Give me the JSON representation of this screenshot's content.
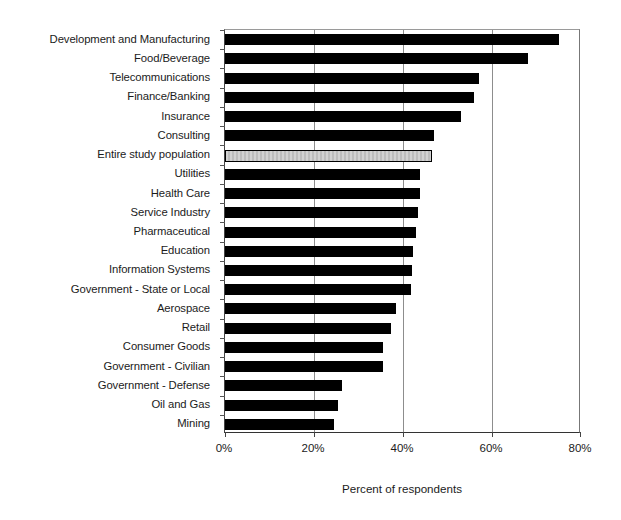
{
  "chart_data": {
    "type": "bar",
    "orientation": "horizontal",
    "title": "",
    "xlabel": "Percent of respondents",
    "ylabel": "",
    "xlim": [
      0,
      80
    ],
    "xunit": "%",
    "xticks": [
      0,
      20,
      40,
      60,
      80
    ],
    "xticklabels": [
      "0%",
      "20%",
      "40%",
      "60%",
      "80%"
    ],
    "grid": "vertical gridlines at 20%, 40%, 60%",
    "legend": "none",
    "bar_color": "#000000",
    "highlight_color": "#c9c9c9",
    "highlight_category": "Entire study population",
    "categories": [
      "Development and Manufacturing",
      "Food/Beverage",
      "Telecommunications",
      "Finance/Banking",
      "Insurance",
      "Consulting",
      "Entire study population",
      "Utilities",
      "Health Care",
      "Service Industry",
      "Pharmaceutical",
      "Education",
      "Information Systems",
      "Government - State or Local",
      "Aerospace",
      "Retail",
      "Consumer Goods",
      "Government - Civilian",
      "Government - Defense",
      "Oil and Gas",
      "Mining"
    ],
    "values": [
      75,
      68,
      57,
      56,
      53,
      47,
      46.5,
      43.8,
      43.8,
      43.3,
      43,
      42.3,
      42,
      41.8,
      38.5,
      37.2,
      35.6,
      35.4,
      26.4,
      25.4,
      24.6
    ]
  }
}
